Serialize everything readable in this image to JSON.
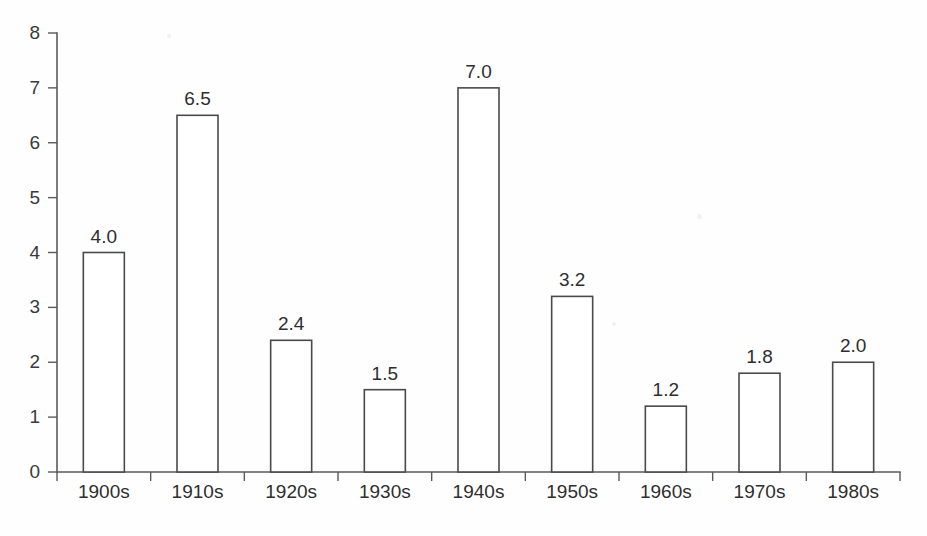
{
  "chart_data": {
    "type": "bar",
    "title": "",
    "subtitle": "",
    "xlabel": "",
    "ylabel": "",
    "categories": [
      "1900s",
      "1910s",
      "1920s",
      "1930s",
      "1940s",
      "1950s",
      "1960s",
      "1970s",
      "1980s"
    ],
    "values": [
      4.0,
      6.5,
      2.4,
      1.5,
      7.0,
      3.2,
      1.2,
      1.8,
      2.0
    ],
    "value_labels": [
      "4.0",
      "6.5",
      "2.4",
      "1.5",
      "7.0",
      "3.2",
      "1.2",
      "1.8",
      "2.0"
    ],
    "ylim": [
      0,
      8
    ],
    "ytick_labels": [
      "0",
      "1",
      "2",
      "3",
      "4",
      "5",
      "6",
      "7",
      "8"
    ],
    "ytick_values": [
      0,
      1,
      2,
      3,
      4,
      5,
      6,
      7,
      8
    ],
    "grid": false,
    "legend": null,
    "legend_position": "none",
    "annotations": [],
    "style": {
      "bar_fill": "#ffffff",
      "bar_stroke": "#4a4a4a",
      "axis_color": "#5a5a5a",
      "text_color": "#2e2e2e",
      "background": "#fefefe"
    }
  },
  "geometry": {
    "plot_left": 57,
    "plot_right": 900,
    "baseline_y": 472,
    "top_y": 33,
    "bar_width": 41,
    "slot_width": 93.6,
    "label_gap": 10,
    "xlabel_y": 484,
    "ytick_text_x": 40,
    "ytick_mark_len": 9,
    "xtick_mark_len": 9
  }
}
